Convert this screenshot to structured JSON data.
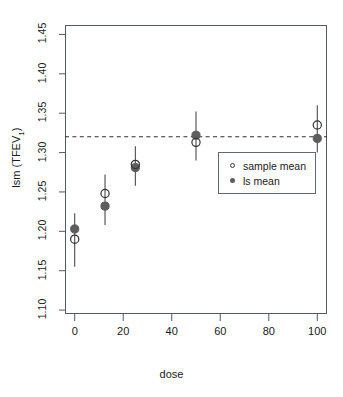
{
  "figure": {
    "truncated_header": "PLOT OF LS MEANS AND SAMPLE MEANS BY DOSE"
  },
  "chart_data": {
    "type": "scatter",
    "title": "",
    "xlabel": "dose",
    "ylabel": "lsm (TFEV1)",
    "ylabel_base": "lsm (TFEV",
    "ylabel_sub": "1",
    "ylabel_close": ")",
    "xlim": [
      -4,
      104
    ],
    "ylim": [
      1.095,
      1.462
    ],
    "xticks": [
      0,
      20,
      40,
      60,
      80,
      100
    ],
    "xtick_labels": [
      "0",
      "20",
      "40",
      "60",
      "80",
      "100"
    ],
    "yticks": [
      1.1,
      1.15,
      1.2,
      1.25,
      1.3,
      1.35,
      1.4,
      1.45
    ],
    "ytick_labels": [
      "1.10",
      "1.15",
      "1.20",
      "1.25",
      "1.30",
      "1.35",
      "1.40",
      "1.45"
    ],
    "grid": false,
    "reference_line": {
      "y": 1.32,
      "style": "dashed",
      "label": "overall ls mean"
    },
    "x": [
      0,
      12.5,
      25,
      50,
      100
    ],
    "series": [
      {
        "name": "sample mean",
        "marker": "open-circle",
        "color": "#333333",
        "values": [
          1.19,
          1.248,
          1.285,
          1.313,
          1.335
        ]
      },
      {
        "name": "ls mean",
        "marker": "filled-circle",
        "color": "#5d5d5d",
        "values": [
          1.203,
          1.232,
          1.281,
          1.322,
          1.318
        ]
      }
    ],
    "error_bars": [
      {
        "x": 0,
        "lower": 1.155,
        "upper": 1.223
      },
      {
        "x": 12.5,
        "lower": 1.208,
        "upper": 1.272
      },
      {
        "x": 25,
        "lower": 1.258,
        "upper": 1.308
      },
      {
        "x": 50,
        "lower": 1.29,
        "upper": 1.352
      },
      {
        "x": 100,
        "lower": 1.3,
        "upper": 1.36
      }
    ],
    "legend": {
      "position": "center-right",
      "entries": [
        {
          "marker": "open-circle",
          "label": "sample mean"
        },
        {
          "marker": "filled-circle",
          "label": "ls mean"
        }
      ]
    }
  }
}
